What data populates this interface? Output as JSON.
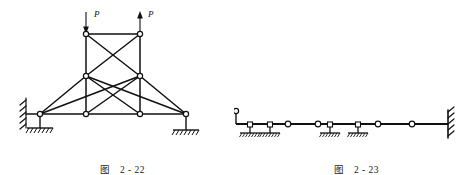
{
  "page": {
    "background": "#ffffff",
    "ink": "#111111",
    "width": 468,
    "height": 175
  },
  "figures": [
    {
      "id": "fig-2-22",
      "caption_label": "图",
      "caption_number": "2 - 22",
      "title": "Braced tower truss on two supports with two vertical forces P",
      "loads": [
        {
          "name": "load-p-left",
          "label": "P",
          "direction": "down",
          "x": 86,
          "y_tip": 33,
          "y_tail": 12
        },
        {
          "name": "load-p-right",
          "label": "P",
          "direction": "up",
          "x": 140,
          "y_tip": 12,
          "y_tail": 33
        }
      ],
      "nodes": [
        {
          "id": "n-top-left",
          "x": 86,
          "y": 34
        },
        {
          "id": "n-top-right",
          "x": 140,
          "y": 34
        },
        {
          "id": "n-mid-left",
          "x": 86,
          "y": 76
        },
        {
          "id": "n-mid-right",
          "x": 140,
          "y": 76
        },
        {
          "id": "n-base-left",
          "x": 40,
          "y": 114
        },
        {
          "id": "n-base-midleft",
          "x": 86,
          "y": 114
        },
        {
          "id": "n-base-midright",
          "x": 140,
          "y": 114
        },
        {
          "id": "n-base-right",
          "x": 186,
          "y": 114
        }
      ],
      "members": [
        [
          "n-top-left",
          "n-top-right"
        ],
        [
          "n-top-left",
          "n-mid-left"
        ],
        [
          "n-top-right",
          "n-mid-right"
        ],
        [
          "n-top-left",
          "n-mid-right"
        ],
        [
          "n-top-right",
          "n-mid-left"
        ],
        [
          "n-mid-left",
          "n-base-midleft"
        ],
        [
          "n-mid-right",
          "n-base-midright"
        ],
        [
          "n-mid-left",
          "n-base-left"
        ],
        [
          "n-mid-right",
          "n-base-right"
        ],
        [
          "n-mid-left",
          "n-base-midright"
        ],
        [
          "n-mid-right",
          "n-base-midleft"
        ],
        [
          "n-base-left",
          "n-mid-right"
        ],
        [
          "n-base-right",
          "n-mid-left"
        ],
        [
          "n-base-left",
          "n-base-midleft"
        ],
        [
          "n-base-midleft",
          "n-base-midright"
        ],
        [
          "n-base-midright",
          "n-base-right"
        ]
      ],
      "supports": [
        {
          "name": "support-left-wall",
          "type": "hatched-wall-vertical",
          "x": 26,
          "y": 114
        },
        {
          "name": "support-left-base",
          "type": "pin-on-ground",
          "x": 40,
          "y": 114
        },
        {
          "name": "support-right-base",
          "type": "pin-on-ground",
          "x": 186,
          "y": 114
        }
      ]
    },
    {
      "id": "fig-2-23",
      "caption_label": "图",
      "caption_number": "2 - 23",
      "title": "Multi-span compound beam with hinges, roller supports and a fixed end",
      "beam": {
        "x_start": 236,
        "x_end": 448,
        "y": 124
      },
      "hinges": [
        {
          "name": "hinge-1",
          "x": 288,
          "y": 124
        },
        {
          "name": "hinge-2",
          "x": 318,
          "y": 124
        },
        {
          "name": "hinge-3",
          "x": 378,
          "y": 124
        },
        {
          "name": "hinge-4",
          "x": 412,
          "y": 124
        }
      ],
      "supports": [
        {
          "name": "support-link-left",
          "type": "vertical-link-pin",
          "x": 236,
          "y": 124
        },
        {
          "name": "support-roller-1",
          "type": "pin-on-ground",
          "x": 250,
          "y": 124
        },
        {
          "name": "support-roller-2",
          "type": "pin-on-ground",
          "x": 270,
          "y": 124
        },
        {
          "name": "support-roller-3",
          "type": "pin-on-ground",
          "x": 330,
          "y": 124
        },
        {
          "name": "support-roller-4",
          "type": "pin-on-ground",
          "x": 358,
          "y": 124
        },
        {
          "name": "support-fixed-right",
          "type": "hatched-wall-fixed",
          "x": 448,
          "y": 124
        }
      ]
    }
  ]
}
